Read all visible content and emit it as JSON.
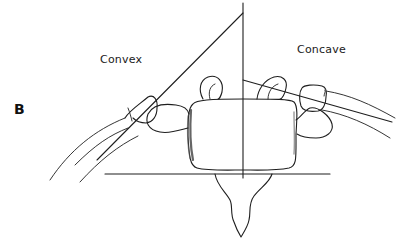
{
  "figure": {
    "panel_letter": "B",
    "labels": {
      "left_side": "Convex",
      "right_side": "Concave"
    },
    "colors": {
      "ink": "#1e1e1e",
      "background": "#ffffff"
    }
  }
}
